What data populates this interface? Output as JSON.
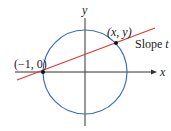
{
  "diagram": {
    "axes": {
      "x_label": "x",
      "y_label": "y"
    },
    "circle": {
      "color": "#3b6fb6",
      "description": "unit circle"
    },
    "line": {
      "color": "#e0383a",
      "slope_label": "Slope t"
    },
    "points": [
      {
        "label": "(−1, 0)"
      },
      {
        "label": "(x, y)"
      }
    ],
    "slope_text_plain": "Slope ",
    "slope_text_var": "t"
  }
}
